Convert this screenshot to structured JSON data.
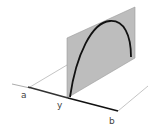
{
  "diagram": {
    "labels": {
      "a": "a",
      "y": "y",
      "b": "b"
    },
    "colors": {
      "plane_fill": "#b8b8b8",
      "plane_edge": "#9a9a9a",
      "curve": "#111111",
      "axis": "#222222",
      "thin_line": "#aaaaaa",
      "label": "#444444"
    }
  }
}
